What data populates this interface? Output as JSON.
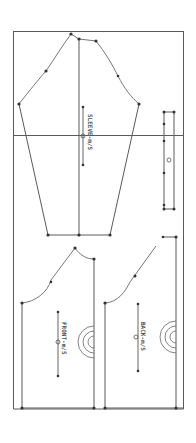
{
  "diagram": {
    "type": "sewing-pattern-layout",
    "colors": {
      "background": "#ffffff",
      "line": "#5a5a5a",
      "point": "#333333",
      "curve": "#777777"
    },
    "pieces": [
      {
        "id": "sleeve",
        "label": "SLEEVE-m/S"
      },
      {
        "id": "front",
        "label": "FRONT-m/S"
      },
      {
        "id": "back",
        "label": "BACK-m/S"
      },
      {
        "id": "strip",
        "label": ""
      }
    ]
  }
}
